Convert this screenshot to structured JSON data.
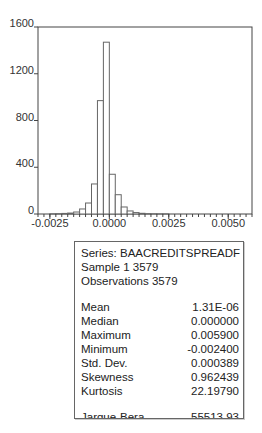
{
  "chart_data": {
    "type": "bar",
    "subtype": "histogram",
    "title": "",
    "xlabel": "",
    "ylabel": "",
    "xlim": [
      -0.003,
      0.006
    ],
    "ylim": [
      0,
      1600
    ],
    "grid": false,
    "yticks": [
      0,
      400,
      800,
      1200,
      1600
    ],
    "xticks": [
      -0.0025,
      0.0,
      0.0025,
      0.005
    ],
    "ytick_labels": [
      "0",
      "400",
      "800",
      "1200",
      "1600"
    ],
    "xtick_labels": [
      "-0.0025",
      "0.0000",
      "0.0025",
      "0.0050"
    ],
    "bin_width": 0.00025,
    "bins": [
      {
        "x0": -0.0025,
        "x1": -0.00225,
        "count": 2
      },
      {
        "x0": -0.00225,
        "x1": -0.002,
        "count": 3
      },
      {
        "x0": -0.002,
        "x1": -0.00175,
        "count": 5
      },
      {
        "x0": -0.00175,
        "x1": -0.0015,
        "count": 8
      },
      {
        "x0": -0.0015,
        "x1": -0.00125,
        "count": 17
      },
      {
        "x0": -0.00125,
        "x1": -0.001,
        "count": 43
      },
      {
        "x0": -0.001,
        "x1": -0.00075,
        "count": 94
      },
      {
        "x0": -0.00075,
        "x1": -0.0005,
        "count": 257
      },
      {
        "x0": -0.0005,
        "x1": -0.00025,
        "count": 970
      },
      {
        "x0": -0.00025,
        "x1": 0.0,
        "count": 1470
      },
      {
        "x0": 0.0,
        "x1": 0.00025,
        "count": 340
      },
      {
        "x0": 0.00025,
        "x1": 0.0005,
        "count": 165
      },
      {
        "x0": 0.0005,
        "x1": 0.00075,
        "count": 60
      },
      {
        "x0": 0.00075,
        "x1": 0.001,
        "count": 26
      },
      {
        "x0": 0.001,
        "x1": 0.00125,
        "count": 12
      },
      {
        "x0": 0.00125,
        "x1": 0.0015,
        "count": 6
      },
      {
        "x0": 0.0015,
        "x1": 0.00175,
        "count": 3
      },
      {
        "x0": 0.00175,
        "x1": 0.002,
        "count": 2
      },
      {
        "x0": 0.002,
        "x1": 0.00225,
        "count": 1
      },
      {
        "x0": 0.00225,
        "x1": 0.0025,
        "count": 1
      }
    ]
  },
  "stats": {
    "series": "Series: BAACREDITSPREADF",
    "sample": "Sample 1 3579",
    "observations": "Observations 3579",
    "rows": [
      {
        "label": "Mean",
        "value": "1.31E-06"
      },
      {
        "label": "Median",
        "value": "0.000000"
      },
      {
        "label": "Maximum",
        "value": "0.005900"
      },
      {
        "label": "Minimum",
        "value": "-0.002400"
      },
      {
        "label": "Std. Dev.",
        "value": "0.000389"
      },
      {
        "label": "Skewness",
        "value": "0.962439"
      },
      {
        "label": "Kurtosis",
        "value": "22.19790"
      }
    ],
    "tests": [
      {
        "label": "Jarque-Bera",
        "value": "55513.93"
      },
      {
        "label": "Probability",
        "value": "0.000000"
      }
    ]
  },
  "colors": {
    "axis": "#444444",
    "bar_edge": "#666666",
    "bar_fill": "#ffffff"
  }
}
